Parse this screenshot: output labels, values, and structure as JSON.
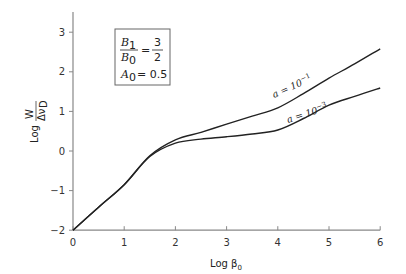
{
  "chart_data": {
    "type": "line",
    "title": "",
    "xlabel": "Log β₀",
    "ylabel": "Log W/Δν_D",
    "xlim": [
      0,
      6
    ],
    "ylim": [
      -2,
      3.5
    ],
    "x_ticks": [
      "0",
      "1",
      "2",
      "3",
      "4",
      "5",
      "6"
    ],
    "y_ticks": [
      "−2",
      "−1",
      "0",
      "1",
      "2",
      "3"
    ],
    "grid": false,
    "legend": null,
    "inset_box": {
      "line1_num": "B",
      "line1_num_sub": "1",
      "line1_den": "B",
      "line1_den_sub": "0",
      "line1_eq": "=",
      "line1_frac_num": "3",
      "line1_frac_den": "2",
      "line2_var": "A",
      "line2_sub": "0",
      "line2_eq": "= 0.5"
    },
    "series": [
      {
        "name": "a = 10⁻¹",
        "label_text": "a = 10",
        "label_exp": "−1",
        "x": [
          0,
          0.5,
          1.0,
          1.5,
          2.0,
          2.5,
          3.0,
          3.5,
          4.0,
          4.5,
          5.0,
          5.5,
          6.0
        ],
        "y": [
          -2.0,
          -1.42,
          -0.85,
          -0.12,
          0.28,
          0.47,
          0.68,
          0.88,
          1.09,
          1.45,
          1.84,
          2.2,
          2.58
        ]
      },
      {
        "name": "a = 10⁻³",
        "label_text": "a = 10",
        "label_exp": "−3",
        "x": [
          0,
          0.5,
          1.0,
          1.5,
          2.0,
          2.5,
          3.0,
          3.5,
          4.0,
          4.5,
          5.0,
          5.5,
          6.0
        ],
        "y": [
          -2.0,
          -1.42,
          -0.85,
          -0.14,
          0.2,
          0.3,
          0.36,
          0.43,
          0.53,
          0.82,
          1.16,
          1.38,
          1.59
        ]
      }
    ]
  }
}
